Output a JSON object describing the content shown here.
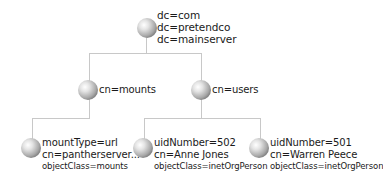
{
  "diagram": {
    "type": "ldap-directory-tree",
    "root": {
      "lines": [
        "dc=com",
        "dc=pretendco",
        "dc=mainserver"
      ]
    },
    "level1": [
      {
        "label": "cn=mounts"
      },
      {
        "label": "cn=users"
      }
    ],
    "leaves": [
      {
        "parent": "cn=mounts",
        "lines": [
          "mountType=url",
          "cn=pantherserver..."
        ],
        "object_class": "objectClass=mounts"
      },
      {
        "parent": "cn=users",
        "lines": [
          "uidNumber=502",
          "cn=Anne Jones"
        ],
        "object_class": "objectClass=inetOrgPerson"
      },
      {
        "parent": "cn=users",
        "lines": [
          "uidNumber=501",
          "cn=Warren Peece"
        ],
        "object_class": "objectClass=inetOrgPerson"
      }
    ],
    "colors": {
      "line": "#c8c8c8",
      "text": "#1a1a1a",
      "node": "#8a8a8a"
    }
  }
}
